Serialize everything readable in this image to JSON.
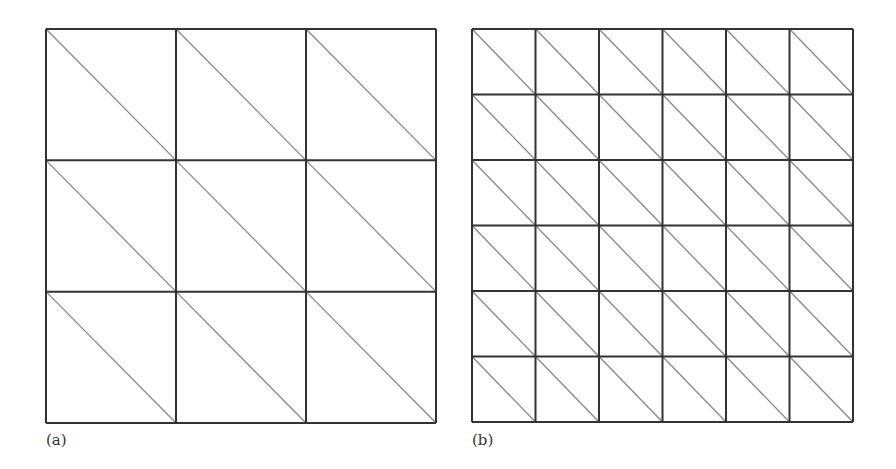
{
  "figure": {
    "panels": [
      {
        "label": "(a)",
        "grid_divisions": 3,
        "box": {
          "x": 46,
          "y": 29,
          "w": 390,
          "h": 394
        },
        "diagonal": "top-left to bottom-right"
      },
      {
        "label": "(b)",
        "grid_divisions": 6,
        "box": {
          "x": 472,
          "y": 29,
          "w": 381,
          "h": 393
        },
        "diagonal": "top-left to bottom-right"
      }
    ],
    "colors": {
      "grid_line": "#333333",
      "diagonal_line": "#888888",
      "background": "#ffffff"
    }
  }
}
